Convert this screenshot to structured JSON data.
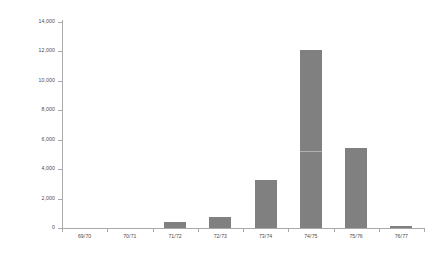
{
  "chart_data": {
    "type": "bar",
    "title": "",
    "subtitle": "",
    "xlabel": "",
    "ylabel": "",
    "categories": [
      "69/70",
      "70/71",
      "71/72",
      "72/73",
      "73/74",
      "74/75",
      "75/76",
      "76/77"
    ],
    "values": [
      0,
      0,
      420,
      750,
      3270,
      12100,
      5440,
      150
    ],
    "series": [
      {
        "name": "",
        "values": [
          0,
          0,
          420,
          750,
          3270,
          12100,
          5440,
          150
        ]
      }
    ],
    "ylim": [
      0,
      14000
    ],
    "ytick_values": [
      0,
      2000,
      4000,
      6000,
      8000,
      10000,
      12000,
      14000
    ],
    "ytick_labels": [
      "0",
      "2,000",
      "4,000",
      "6,000",
      "8,000",
      "10,000",
      "12,000",
      "14,000"
    ],
    "grid": false,
    "legend": "none",
    "bar_color": "#808080",
    "axis_color": "#a9a9a9",
    "text_color": "#4d4d4d",
    "background_color": "#ffffff"
  }
}
